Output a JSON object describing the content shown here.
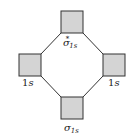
{
  "diagram": {
    "type": "molecular-orbital",
    "colors": {
      "box_fill": "#d4d4d4",
      "line": "#333333"
    },
    "orbitals": {
      "top": {
        "symbol": "σ",
        "subscript": "1s",
        "superscript": "*"
      },
      "left": {
        "number": "1",
        "letter": "s"
      },
      "right": {
        "number": "1",
        "letter": "s"
      },
      "bottom": {
        "symbol": "σ",
        "subscript": "1s"
      }
    }
  }
}
